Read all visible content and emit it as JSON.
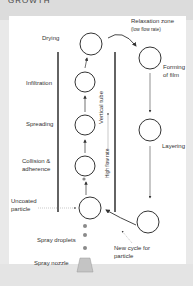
{
  "header": {
    "title": "GROWTH"
  },
  "diagram": {
    "stages_left": {
      "drying": "Drying",
      "infiltration": "Infiltration",
      "spreading": "Spreading",
      "collision": [
        "Collision &",
        "adherence"
      ],
      "uncoated": [
        "Uncoated",
        "particle"
      ],
      "droplets": "Spray droplets",
      "nozzle": "Spray nozzle"
    },
    "right": {
      "relaxation": "Relaxation zone",
      "relaxation_sub": "(low flow rate)",
      "forming": [
        "Forming",
        "of film"
      ],
      "layering": "Layering",
      "new_cycle": [
        "New cycle for",
        "particle"
      ]
    },
    "tube": {
      "vertical": "Vertical tube",
      "flow": "High flow rate"
    },
    "colors": {
      "line": "#333333",
      "droplet": "#8a8a8a",
      "nozzle": "#bdbdbd"
    }
  }
}
